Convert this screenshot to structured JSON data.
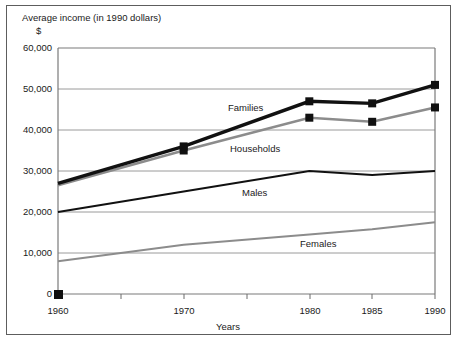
{
  "chart_data": {
    "type": "line",
    "title": "Average income (in 1990 dollars)",
    "y_unit_symbol": "$",
    "xlabel": "Years",
    "ylabel": "",
    "x": [
      1960,
      1970,
      1980,
      1985,
      1990
    ],
    "xlim": [
      1960,
      1990
    ],
    "ylim": [
      0,
      60000
    ],
    "xticks": [
      1960,
      1965,
      1970,
      1975,
      1980,
      1985,
      1990
    ],
    "xticklabels": [
      "1960",
      "",
      "1970",
      "",
      "1980",
      "1985",
      "1990"
    ],
    "yticks": [
      0,
      10000,
      20000,
      30000,
      40000,
      50000,
      60000
    ],
    "yticklabels": [
      "0",
      "10,000",
      "20,000",
      "30,000",
      "40,000",
      "50,000",
      "60,000"
    ],
    "grid": "horizontal",
    "legend": "inline-labels",
    "series": [
      {
        "name": "Families",
        "color": "#111111",
        "style": "thick-black",
        "markers": true,
        "values": [
          27000,
          36000,
          47000,
          46500,
          51000
        ]
      },
      {
        "name": "Households",
        "color": "#8c8c8c",
        "style": "thick-gray",
        "markers": true,
        "values": [
          26500,
          35000,
          43000,
          42000,
          45500
        ]
      },
      {
        "name": "Males",
        "color": "#111111",
        "style": "thin-black",
        "markers": false,
        "values": [
          20000,
          25000,
          30000,
          29000,
          30000
        ]
      },
      {
        "name": "Females",
        "color": "#8c8c8c",
        "style": "thin-gray",
        "markers": false,
        "values": [
          8000,
          12000,
          14500,
          15800,
          17500
        ]
      }
    ],
    "annotations": [
      {
        "text": "Families",
        "x": 228,
        "y": 111
      },
      {
        "text": "Households",
        "x": 230,
        "y": 152
      },
      {
        "text": "Males",
        "x": 242,
        "y": 196
      },
      {
        "text": "Females",
        "x": 300,
        "y": 247
      }
    ],
    "origin_marker": true
  },
  "colors": {
    "series_dark": "#111111",
    "series_gray": "#8c8c8c",
    "gridline": "#9a9a9a",
    "frame": "#7a7a7a",
    "border": "#5d5d5d",
    "text": "#1a1a1a",
    "background": "#ffffff"
  }
}
